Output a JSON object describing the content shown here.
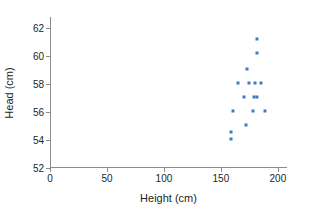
{
  "chart_data": {
    "type": "scatter",
    "title": "",
    "xlabel": "Height (cm)",
    "ylabel": "Head (cm)",
    "xlim": [
      0,
      208
    ],
    "ylim": [
      52,
      62.8
    ],
    "xticks": [
      0,
      50,
      100,
      150,
      200
    ],
    "yticks": [
      52,
      54,
      56,
      58,
      60,
      62
    ],
    "xtick_labels": [
      "0",
      "50",
      "100",
      "150",
      "200"
    ],
    "ytick_labels": [
      "52",
      "54",
      "56",
      "58",
      "60",
      "62"
    ],
    "grid": false,
    "legend": null,
    "marker": "square",
    "marker_color": "#3a7ec1",
    "axis_color": "#8c8c8c",
    "series": [
      {
        "name": "Head circumference vs height",
        "points": [
          {
            "x": 182,
            "y": 61.2
          },
          {
            "x": 182,
            "y": 60.2
          },
          {
            "x": 173,
            "y": 59.1
          },
          {
            "x": 165,
            "y": 58.1
          },
          {
            "x": 175,
            "y": 58.1
          },
          {
            "x": 180,
            "y": 58.1
          },
          {
            "x": 185,
            "y": 58.1
          },
          {
            "x": 170,
            "y": 57.1
          },
          {
            "x": 179,
            "y": 57.1
          },
          {
            "x": 182,
            "y": 57.1
          },
          {
            "x": 161,
            "y": 56.1
          },
          {
            "x": 178,
            "y": 56.1
          },
          {
            "x": 189,
            "y": 56.1
          },
          {
            "x": 172,
            "y": 55.1
          },
          {
            "x": 159,
            "y": 54.6
          },
          {
            "x": 159,
            "y": 54.1
          }
        ]
      }
    ]
  }
}
